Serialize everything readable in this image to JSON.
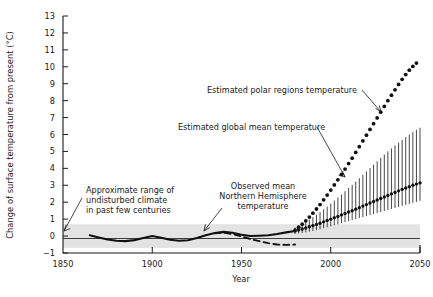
{
  "chart_data": {
    "type": "line",
    "title": "",
    "xlabel": "Year",
    "ylabel": "Change of surface temperature from present (°C)",
    "xlim": [
      1850,
      2050
    ],
    "ylim": [
      -1,
      13
    ],
    "xticks": [
      1850,
      1900,
      1950,
      2000,
      2050
    ],
    "yticks": [
      -1,
      0,
      1,
      2,
      3,
      4,
      5,
      6,
      7,
      8,
      9,
      10,
      11,
      12,
      13
    ],
    "grid": false,
    "legend_position": "none",
    "series": [
      {
        "name": "Observed mean Northern Hemisphere temperature",
        "style": "solid-thick-line",
        "x": [
          1865,
          1870,
          1875,
          1880,
          1885,
          1890,
          1895,
          1900,
          1905,
          1910,
          1915,
          1920,
          1925,
          1930,
          1935,
          1940,
          1945,
          1950,
          1955,
          1960,
          1965,
          1970,
          1975,
          1980
        ],
        "values": [
          0.05,
          -0.08,
          -0.2,
          -0.28,
          -0.3,
          -0.24,
          -0.12,
          0.0,
          -0.1,
          -0.22,
          -0.28,
          -0.25,
          -0.12,
          0.05,
          0.18,
          0.25,
          0.2,
          0.08,
          0.0,
          0.02,
          0.05,
          0.12,
          0.22,
          0.3
        ]
      },
      {
        "name": "Observed lower dashed branch",
        "style": "dashed-line",
        "x": [
          1935,
          1940,
          1945,
          1950,
          1955,
          1960,
          1965,
          1970,
          1975,
          1980
        ],
        "values": [
          0.16,
          0.2,
          0.12,
          -0.02,
          -0.18,
          -0.3,
          -0.42,
          -0.5,
          -0.52,
          -0.5
        ]
      },
      {
        "name": "Estimated global mean temperature",
        "style": "dotted-with-error-bars",
        "x": [
          1980,
          1982,
          1984,
          1986,
          1988,
          1990,
          1992,
          1994,
          1996,
          1998,
          2000,
          2002,
          2004,
          2006,
          2008,
          2010,
          2012,
          2014,
          2016,
          2018,
          2020,
          2022,
          2024,
          2026,
          2028,
          2030,
          2032,
          2034,
          2036,
          2038,
          2040,
          2042,
          2044,
          2046,
          2048,
          2050
        ],
        "values": [
          0.3,
          0.36,
          0.42,
          0.48,
          0.55,
          0.62,
          0.69,
          0.76,
          0.84,
          0.92,
          1.0,
          1.08,
          1.16,
          1.25,
          1.33,
          1.42,
          1.5,
          1.59,
          1.68,
          1.77,
          1.86,
          1.95,
          2.04,
          2.13,
          2.22,
          2.31,
          2.4,
          2.49,
          2.58,
          2.67,
          2.76,
          2.84,
          2.92,
          3.0,
          3.07,
          3.14
        ],
        "error_low": [
          0.12,
          0.15,
          0.18,
          0.22,
          0.26,
          0.3,
          0.35,
          0.4,
          0.46,
          0.52,
          0.58,
          0.64,
          0.7,
          0.76,
          0.82,
          0.88,
          0.94,
          1.0,
          1.06,
          1.12,
          1.18,
          1.24,
          1.3,
          1.36,
          1.42,
          1.48,
          1.54,
          1.6,
          1.66,
          1.72,
          1.78,
          1.84,
          1.9,
          1.96,
          2.02,
          2.08
        ],
        "error_high": [
          0.5,
          0.6,
          0.72,
          0.85,
          0.98,
          1.12,
          1.26,
          1.42,
          1.58,
          1.74,
          1.92,
          2.1,
          2.28,
          2.46,
          2.65,
          2.84,
          3.03,
          3.22,
          3.42,
          3.62,
          3.82,
          4.02,
          4.22,
          4.42,
          4.62,
          4.82,
          5.0,
          5.18,
          5.36,
          5.52,
          5.68,
          5.84,
          6.0,
          6.14,
          6.28,
          6.4
        ]
      },
      {
        "name": "Estimated polar regions temperature",
        "style": "dotted-line",
        "x": [
          1980,
          1982,
          1984,
          1986,
          1988,
          1990,
          1992,
          1994,
          1996,
          1998,
          2000,
          2002,
          2004,
          2006,
          2008,
          2010,
          2012,
          2014,
          2016,
          2018,
          2020,
          2022,
          2024,
          2026,
          2028,
          2030,
          2032,
          2034,
          2036,
          2038,
          2040,
          2042,
          2044,
          2046,
          2048
        ],
        "values": [
          0.35,
          0.52,
          0.7,
          0.9,
          1.12,
          1.35,
          1.6,
          1.86,
          2.14,
          2.42,
          2.72,
          3.02,
          3.32,
          3.64,
          3.96,
          4.28,
          4.6,
          4.94,
          5.28,
          5.62,
          5.96,
          6.3,
          6.64,
          6.98,
          7.32,
          7.66,
          8.0,
          8.32,
          8.64,
          8.96,
          9.26,
          9.54,
          9.8,
          10.02,
          10.22
        ]
      }
    ],
    "bands": [
      {
        "name": "Approximate range of undisturbed climate in past few centuries",
        "ylow": -0.7,
        "yhigh": 0.7,
        "color": "#e3e3e3"
      }
    ],
    "annotations": [
      {
        "id": "polar",
        "text": "Estimated polar regions temperature"
      },
      {
        "id": "global",
        "text": "Estimated global mean temperature"
      },
      {
        "id": "observed",
        "line1": "Observed mean",
        "line2": "Northern Hemisphere",
        "line3": "temperature"
      },
      {
        "id": "range",
        "line1": "Approximate range of",
        "line2": "undisturbed climate",
        "line3": "in past few centuries"
      }
    ]
  },
  "axes": {
    "x_title": "Year",
    "y_title": "Change of surface temperature from present (°C)",
    "x_tick_labels": [
      "1850",
      "1900",
      "1950",
      "2000",
      "2050"
    ],
    "y_tick_labels": [
      "13",
      "12",
      "11",
      "10",
      "9",
      "8",
      "7",
      "6",
      "5",
      "4",
      "3",
      "2",
      "1",
      "0",
      "−1"
    ]
  },
  "colors": {
    "ink": "#1a1a1a",
    "band": "#e3e3e3",
    "data": "#111111"
  }
}
